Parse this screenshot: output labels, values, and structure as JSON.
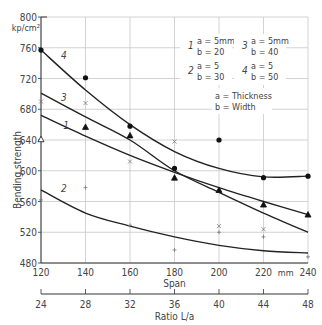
{
  "chart_data": {
    "type": "line",
    "title": "",
    "ylabel": "Bending strength",
    "y_unit": "kp/cm²",
    "xlabel": "Span",
    "x_unit": "mm",
    "x2label": "Ratio L/a",
    "ylim": [
      480,
      800
    ],
    "xlim": [
      120,
      240
    ],
    "grid": true,
    "y_ticks": [
      480,
      520,
      560,
      600,
      640,
      680,
      720,
      760,
      800
    ],
    "x_ticks": [
      120,
      140,
      160,
      180,
      200,
      220,
      240
    ],
    "x2_ticks": [
      24,
      28,
      32,
      36,
      40,
      44,
      48
    ],
    "legend": [
      {
        "id": "1",
        "a": "a = 5mm",
        "b": "b = 20",
        "marker": "x"
      },
      {
        "id": "2",
        "a": "a = 5",
        "b": "b = 30",
        "marker": "+"
      },
      {
        "id": "3",
        "a": "a = 5mm",
        "b": "b = 40",
        "marker": "triangle"
      },
      {
        "id": "4",
        "a": "a = 5",
        "b": "b = 50",
        "marker": "circle"
      }
    ],
    "legend_note": [
      "a = Thickness",
      "b = Width"
    ],
    "x": [
      120,
      140,
      160,
      180,
      200,
      220,
      240
    ],
    "curves": [
      {
        "name": "1",
        "values": [
          672,
          645,
          620,
          598,
          578,
          560,
          543
        ]
      },
      {
        "name": "2",
        "values": [
          575,
          545,
          528,
          514,
          503,
          496,
          493
        ]
      },
      {
        "name": "3",
        "values": [
          701,
          670,
          640,
          600,
          572,
          545,
          520
        ]
      },
      {
        "name": "4",
        "values": [
          757,
          705,
          660,
          625,
          603,
          592,
          593
        ]
      }
    ],
    "points": [
      {
        "name": "x marks",
        "marker": "x",
        "x": [
          120,
          140,
          160,
          180,
          200,
          220
        ],
        "values": [
          690,
          688,
          612,
          638,
          528,
          524
        ]
      },
      {
        "name": "+ marks",
        "marker": "+",
        "x": [
          120,
          140,
          160,
          180,
          200,
          220,
          240
        ],
        "values": [
          562,
          578,
          529,
          497,
          520,
          514,
          488
        ]
      },
      {
        "name": "triangles",
        "marker": "triangle",
        "x": [
          120,
          140,
          160,
          180,
          200,
          220,
          240
        ],
        "values": [
          641,
          657,
          646,
          591,
          575,
          556,
          543
        ]
      },
      {
        "name": "circles",
        "marker": "circle",
        "x": [
          120,
          140,
          160,
          180,
          200,
          220,
          240
        ],
        "values": [
          757,
          721,
          658,
          603,
          640,
          591,
          593
        ]
      }
    ]
  }
}
